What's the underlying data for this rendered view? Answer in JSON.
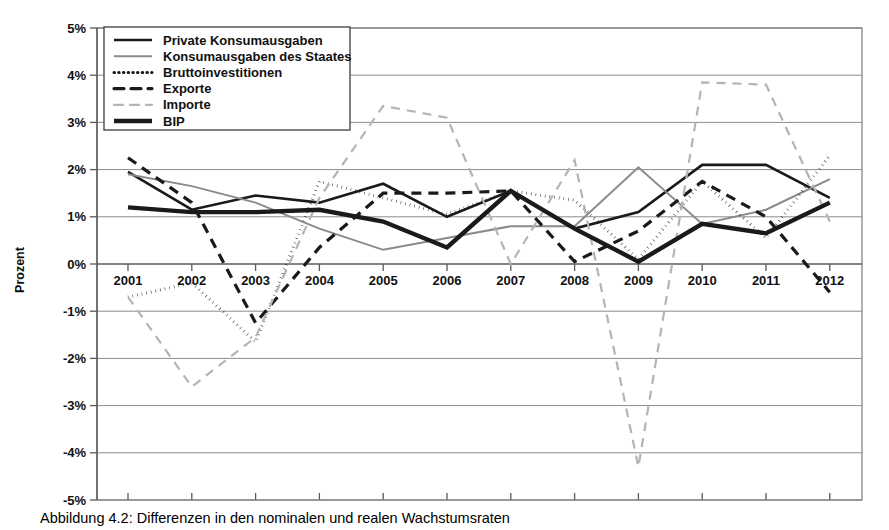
{
  "axis": {
    "ylabel": "Prozent",
    "yticks": [
      "5%",
      "4%",
      "3%",
      "2%",
      "1%",
      "0%",
      "-1%",
      "-2%",
      "-3%",
      "-4%",
      "-5%"
    ],
    "xticks": [
      "2001",
      "2002",
      "2003",
      "2004",
      "2005",
      "2006",
      "2007",
      "2008",
      "2009",
      "2010",
      "2011",
      "2012"
    ]
  },
  "legend": {
    "items": [
      {
        "label": "Private Konsumausgaben",
        "style": "solid-thin-dark"
      },
      {
        "label": "Konsumausgaben des Staates",
        "style": "solid-thin-gray"
      },
      {
        "label": "Bruttoinvestitionen",
        "style": "dotted-dark"
      },
      {
        "label": "Exporte",
        "style": "dashed-dark"
      },
      {
        "label": "Importe",
        "style": "dashed-gray"
      },
      {
        "label": "BIP",
        "style": "solid-thick-dark"
      }
    ]
  },
  "caption": {
    "text": "Abbildung 4.2: Differenzen in den nominalen und realen Wachstumsraten"
  },
  "colors": {
    "dark": "#1a1a1a",
    "gray": "#8a8a8a",
    "light_gray": "#b4b4b4",
    "grid": "#8c8c8c",
    "background": "#ffffff"
  },
  "chart_data": {
    "type": "line",
    "title": "",
    "xlabel": "",
    "ylabel": "Prozent",
    "x": [
      "2001",
      "2002",
      "2003",
      "2004",
      "2005",
      "2006",
      "2007",
      "2008",
      "2009",
      "2010",
      "2011",
      "2012"
    ],
    "ylim": [
      -5,
      5
    ],
    "ytick_step": 1,
    "grid": true,
    "legend_position": "top-left",
    "series": [
      {
        "name": "Private Konsumausgaben",
        "style": "solid-thin-dark",
        "values": [
          1.95,
          1.15,
          1.45,
          1.3,
          1.7,
          1.0,
          1.55,
          0.75,
          1.1,
          2.1,
          2.1,
          1.4
        ]
      },
      {
        "name": "Konsumausgaben des Staates",
        "style": "solid-thin-gray",
        "values": [
          1.9,
          1.65,
          1.3,
          0.75,
          0.3,
          0.55,
          0.8,
          0.8,
          2.05,
          0.85,
          1.15,
          1.8
        ]
      },
      {
        "name": "Bruttoinvestitionen",
        "style": "dotted-dark",
        "values": [
          -0.7,
          -0.4,
          -1.65,
          1.75,
          1.4,
          1.05,
          1.55,
          1.35,
          0.1,
          1.75,
          0.55,
          2.3
        ]
      },
      {
        "name": "Exporte",
        "style": "dashed-dark",
        "values": [
          2.25,
          1.3,
          -1.25,
          0.35,
          1.5,
          1.5,
          1.55,
          0.05,
          0.7,
          1.75,
          1.0,
          -0.6
        ]
      },
      {
        "name": "Importe",
        "style": "dashed-gray",
        "values": [
          -0.7,
          -2.6,
          -1.55,
          1.4,
          3.35,
          3.1,
          0.0,
          2.2,
          -4.3,
          3.85,
          3.8,
          0.9
        ]
      },
      {
        "name": "BIP",
        "style": "solid-thick-dark",
        "values": [
          1.2,
          1.1,
          1.1,
          1.15,
          0.9,
          0.35,
          1.55,
          0.75,
          0.05,
          0.85,
          0.65,
          1.3
        ]
      }
    ]
  }
}
